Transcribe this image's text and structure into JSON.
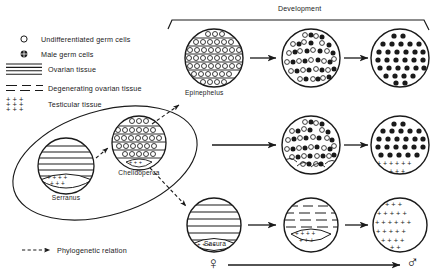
{
  "figure": {
    "title_top": "Development",
    "phylo_legend": "Phylogenetic relation",
    "female_symbol": "♀",
    "male_symbol": "♂"
  },
  "legend": {
    "items": [
      {
        "key": "undifferentiated-germ-cells",
        "label": "Undifferentiated  germ  cells",
        "symbol": "open-circle"
      },
      {
        "key": "male-germ-cells",
        "label": "Male  germ  cells",
        "symbol": "filled-circle"
      },
      {
        "key": "ovarian-tissue",
        "label": "Ovarian   tissue",
        "symbol": "solid-horizontal-lines"
      },
      {
        "key": "degenerating-ovarian-tissue",
        "label": "Degenerating  ovarian  tissue",
        "symbol": "dashed-horizontal-lines"
      },
      {
        "key": "testicular-tissue",
        "label": "Testicular  tissue",
        "symbol": "plus-marks"
      }
    ]
  },
  "taxa": {
    "serranus": "Serranus",
    "chelidoperca": "Chelidoperca",
    "epinephelus": "Epinephelus",
    "sacura": "Sacura"
  },
  "rows": [
    {
      "name": "epinephelus-row",
      "taxon": "Epinephelus",
      "stages": [
        {
          "name": "stage-1",
          "tissue": "ovarian",
          "cells": "undifferentiated"
        },
        {
          "name": "stage-2",
          "tissue": "none",
          "cells": "mixed"
        },
        {
          "name": "stage-3",
          "tissue": "none",
          "cells": "male"
        }
      ]
    },
    {
      "name": "chelidoperca-row",
      "taxon": "Chelidoperca",
      "stages": [
        {
          "name": "stage-1",
          "tissue": "ovarian",
          "cells": "undifferentiated"
        },
        {
          "name": "stage-2",
          "tissue": "testicular-crescent",
          "cells": "mixed"
        },
        {
          "name": "stage-3",
          "tissue": "testicular-lower",
          "cells": "male"
        }
      ]
    },
    {
      "name": "sacura-row",
      "taxon": "Sacura",
      "stages": [
        {
          "name": "stage-1",
          "tissue": "ovarian",
          "cells": "none"
        },
        {
          "name": "stage-2",
          "tissue": "degenerating-ovarian",
          "cells": "none"
        },
        {
          "name": "stage-3",
          "tissue": "testicular",
          "cells": "none"
        }
      ]
    }
  ]
}
